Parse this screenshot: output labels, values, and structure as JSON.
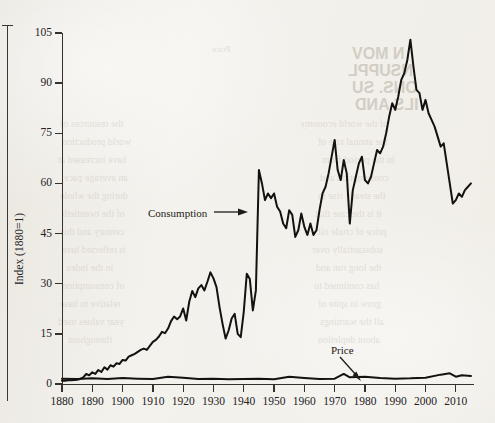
{
  "figure": {
    "background_color": "#f3f1ec",
    "ink_color": "#23211e"
  },
  "chart_data": {
    "type": "line",
    "title": "",
    "subtitle": "",
    "xlabel": "",
    "ylabel": "Index (1880=1)",
    "xlim": [
      1880,
      2016
    ],
    "ylim": [
      0,
      105
    ],
    "grid": false,
    "legend_position": "inline-annotations",
    "x_ticks": [
      1880,
      1890,
      1900,
      1910,
      1920,
      1930,
      1940,
      1950,
      1960,
      1970,
      1980,
      1990,
      2000,
      2010
    ],
    "y_ticks": [
      0,
      15,
      30,
      45,
      60,
      75,
      90,
      105
    ],
    "annotations": [
      {
        "text": "Consumption",
        "arrow": "right",
        "target_year": 1940,
        "target_value": 53
      },
      {
        "text": "Price",
        "arrow": "down-right",
        "target_year": 1974,
        "target_value": 3
      }
    ],
    "series": [
      {
        "name": "Consumption",
        "x": [
          1880,
          1881,
          1882,
          1883,
          1884,
          1885,
          1886,
          1887,
          1888,
          1889,
          1890,
          1891,
          1892,
          1893,
          1894,
          1895,
          1896,
          1897,
          1898,
          1899,
          1900,
          1901,
          1902,
          1903,
          1904,
          1905,
          1906,
          1907,
          1908,
          1909,
          1910,
          1911,
          1912,
          1913,
          1914,
          1915,
          1916,
          1917,
          1918,
          1919,
          1920,
          1921,
          1922,
          1923,
          1924,
          1925,
          1926,
          1927,
          1928,
          1929,
          1930,
          1931,
          1932,
          1933,
          1934,
          1935,
          1936,
          1937,
          1938,
          1939,
          1940,
          1941,
          1942,
          1943,
          1944,
          1945,
          1946,
          1947,
          1948,
          1949,
          1950,
          1951,
          1952,
          1953,
          1954,
          1955,
          1956,
          1957,
          1958,
          1959,
          1960,
          1961,
          1962,
          1963,
          1964,
          1965,
          1966,
          1967,
          1968,
          1969,
          1970,
          1971,
          1972,
          1973,
          1974,
          1975,
          1976,
          1977,
          1978,
          1979,
          1980,
          1981,
          1982,
          1983,
          1984,
          1985,
          1986,
          1987,
          1988,
          1989,
          1990,
          1991,
          1992,
          1993,
          1994,
          1995,
          1996,
          1997,
          1998,
          1999,
          2000,
          2001,
          2002,
          2003,
          2004,
          2005,
          2006,
          2007,
          2008,
          2009,
          2010,
          2011,
          2012,
          2013,
          2014,
          2015
        ],
        "values": [
          1.0,
          1.0,
          1.1,
          1.1,
          1.2,
          1.3,
          1.5,
          2.0,
          3.0,
          2.6,
          3.5,
          3.0,
          4.2,
          3.6,
          5.0,
          4.3,
          5.6,
          5.2,
          6.2,
          6.0,
          7.2,
          7.0,
          8.2,
          8.6,
          9.0,
          9.6,
          10.2,
          10.6,
          10.2,
          11.4,
          12.6,
          13.2,
          14.2,
          15.6,
          15.2,
          16.6,
          18.8,
          20.2,
          19.4,
          20.2,
          22.6,
          19.0,
          24.6,
          27.8,
          26.0,
          28.6,
          29.6,
          28.0,
          30.6,
          33.4,
          31.6,
          29.0,
          23.0,
          18.0,
          13.6,
          16.0,
          19.6,
          21.0,
          15.0,
          14.0,
          21.6,
          33.0,
          31.4,
          22.0,
          28.0,
          64.0,
          60.0,
          55.0,
          57.0,
          55.6,
          57.0,
          53.0,
          51.6,
          48.0,
          46.6,
          52.0,
          50.6,
          44.0,
          46.0,
          51.0,
          47.0,
          44.6,
          48.0,
          44.6,
          46.0,
          52.0,
          57.0,
          59.0,
          63.0,
          68.0,
          73.0,
          64.0,
          61.0,
          67.0,
          63.0,
          48.0,
          58.0,
          62.0,
          66.0,
          68.0,
          61.0,
          60.0,
          62.0,
          66.0,
          70.0,
          69.0,
          71.0,
          75.0,
          80.0,
          84.0,
          82.0,
          86.0,
          91.0,
          93.0,
          97.0,
          103.0,
          95.0,
          88.0,
          87.0,
          82.0,
          85.0,
          81.0,
          79.0,
          77.0,
          74.0,
          71.0,
          72.0,
          66.0,
          60.0,
          54.0,
          55.0,
          57.0,
          56.0,
          58.0,
          59.0,
          60.0
        ],
        "color": "#141210",
        "linewidth": 2.0
      },
      {
        "name": "Price",
        "x": [
          1880,
          1885,
          1890,
          1895,
          1900,
          1905,
          1910,
          1915,
          1920,
          1925,
          1930,
          1935,
          1940,
          1945,
          1950,
          1955,
          1960,
          1965,
          1970,
          1973,
          1975,
          1980,
          1985,
          1990,
          1995,
          2000,
          2005,
          2008,
          2010,
          2012,
          2015
        ],
        "values": [
          1.6,
          1.5,
          1.7,
          1.5,
          1.8,
          1.6,
          1.5,
          2.2,
          1.9,
          1.5,
          1.6,
          1.4,
          1.5,
          1.6,
          1.4,
          2.2,
          1.8,
          1.5,
          1.6,
          3.0,
          2.0,
          2.2,
          1.8,
          1.6,
          1.7,
          1.9,
          2.8,
          3.2,
          2.2,
          2.6,
          2.4
        ],
        "color": "#141210",
        "linewidth": 2.0
      }
    ]
  },
  "bleed_through_text": [
    {
      "text": "N MOV",
      "x": 352,
      "y": 45,
      "size": 16,
      "head": true
    },
    {
      "text": "NSUPPL",
      "x": 348,
      "y": 62,
      "size": 16,
      "head": true
    },
    {
      "text": "ONS. SU",
      "x": 352,
      "y": 79,
      "size": 16,
      "head": true
    },
    {
      "text": "ILS AND",
      "x": 355,
      "y": 96,
      "size": 16,
      "head": true
    },
    {
      "text": "of the world economy",
      "x": 300,
      "y": 118,
      "size": 10,
      "head": false
    },
    {
      "text": "the annual rate of",
      "x": 318,
      "y": 136,
      "size": 10,
      "head": false
    },
    {
      "text": "in the period from",
      "x": 322,
      "y": 154,
      "size": 10,
      "head": false
    },
    {
      "text": "consumption and",
      "x": 320,
      "y": 172,
      "size": 10,
      "head": false
    },
    {
      "text": "the steady rise in",
      "x": 318,
      "y": 190,
      "size": 10,
      "head": false
    },
    {
      "text": "it is the case that",
      "x": 315,
      "y": 208,
      "size": 10,
      "head": false
    },
    {
      "text": "price of crude oil",
      "x": 318,
      "y": 226,
      "size": 10,
      "head": false
    },
    {
      "text": "substantially over",
      "x": 312,
      "y": 244,
      "size": 10,
      "head": false
    },
    {
      "text": "the long run and",
      "x": 316,
      "y": 262,
      "size": 10,
      "head": false
    },
    {
      "text": "has continued to",
      "x": 314,
      "y": 280,
      "size": 10,
      "head": false
    },
    {
      "text": "grow in spite of",
      "x": 318,
      "y": 298,
      "size": 10,
      "head": false
    },
    {
      "text": "all the warnings",
      "x": 320,
      "y": 316,
      "size": 10,
      "head": false
    },
    {
      "text": "about depletion",
      "x": 318,
      "y": 334,
      "size": 10,
      "head": false
    },
    {
      "text": "the resources of",
      "x": 60,
      "y": 118,
      "size": 10,
      "head": false
    },
    {
      "text": "world production",
      "x": 62,
      "y": 136,
      "size": 10,
      "head": false
    },
    {
      "text": "have increased at",
      "x": 58,
      "y": 154,
      "size": 10,
      "head": false
    },
    {
      "text": "an average pace",
      "x": 64,
      "y": 172,
      "size": 10,
      "head": false
    },
    {
      "text": "during the whole",
      "x": 60,
      "y": 190,
      "size": 10,
      "head": false
    },
    {
      "text": "of the twentieth",
      "x": 62,
      "y": 208,
      "size": 10,
      "head": false
    },
    {
      "text": "century and this",
      "x": 60,
      "y": 226,
      "size": 10,
      "head": false
    },
    {
      "text": "is reflected here",
      "x": 62,
      "y": 244,
      "size": 10,
      "head": false
    },
    {
      "text": "in the index",
      "x": 66,
      "y": 262,
      "size": 10,
      "head": false
    },
    {
      "text": "of consumption",
      "x": 62,
      "y": 280,
      "size": 10,
      "head": false
    },
    {
      "text": "relative to base",
      "x": 60,
      "y": 298,
      "size": 10,
      "head": false
    },
    {
      "text": "year values used",
      "x": 58,
      "y": 316,
      "size": 10,
      "head": false
    },
    {
      "text": "throughout",
      "x": 68,
      "y": 334,
      "size": 10,
      "head": false
    },
    {
      "text": "Price",
      "x": 212,
      "y": 44,
      "size": 9,
      "head": false
    }
  ]
}
